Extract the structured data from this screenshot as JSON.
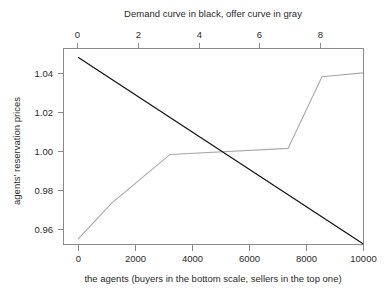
{
  "chart_data": {
    "type": "line",
    "title": "Demand curve in black, offer curve in gray",
    "xlabel": "the agents (buyers in the bottom scale, sellers in the top one)",
    "ylabel": "agents' reservation prices",
    "grid": false,
    "legend": "none",
    "xlim": [
      0,
      10000
    ],
    "ylim": [
      0.9505,
      1.0495
    ],
    "xticks": [
      0,
      2000,
      4000,
      6000,
      8000,
      10000
    ],
    "xtick_labels": [
      "0",
      "2000",
      "4000",
      "6000",
      "8000",
      "10000"
    ],
    "yticks": [
      0.96,
      0.98,
      1.0,
      1.02,
      1.04
    ],
    "ytick_labels": [
      "0.96",
      "0.98",
      "1.00",
      "1.02",
      "1.04"
    ],
    "top_axis": {
      "label": "sellers",
      "lim": [
        0,
        9.4
      ],
      "ticks": [
        0,
        2,
        4,
        6,
        8
      ],
      "tick_labels": [
        "0",
        "2",
        "4",
        "6",
        "8"
      ]
    },
    "series": [
      {
        "name": "Demand curve",
        "color": "#111111",
        "style": "solid",
        "x": [
          0,
          10000
        ],
        "y": [
          1.0483,
          0.9527
        ]
      },
      {
        "name": "Offer curve",
        "color": "#a9a9a9",
        "style": "solid",
        "x": [
          0,
          1190,
          3230,
          7370,
          8560,
          10000
        ],
        "y": [
          0.9551,
          0.9737,
          0.9985,
          1.0016,
          1.0383,
          1.0403
        ]
      }
    ],
    "intersection": {
      "x": 4950,
      "y": 1.0008
    }
  },
  "figure": {
    "title_text": "Demand curve in black, offer curve in gray",
    "y_axis_title": "agents' reservation prices",
    "x_axis_title": "the agents (buyers in the bottom scale, sellers in the top one)",
    "x_tick_0": "0",
    "x_tick_1": "2000",
    "x_tick_2": "4000",
    "x_tick_3": "6000",
    "x_tick_4": "8000",
    "x_tick_5": "10000",
    "y_tick_0": "0.96",
    "y_tick_1": "0.98",
    "y_tick_2": "1.00",
    "y_tick_3": "1.02",
    "y_tick_4": "1.04",
    "top_tick_0": "0",
    "top_tick_1": "2",
    "top_tick_2": "4",
    "top_tick_3": "6",
    "top_tick_4": "8"
  },
  "colors": {
    "demand": "#111111",
    "offer": "#a9a9a9",
    "frame": "#8a8a8a",
    "background": "#ffffff",
    "text": "#2b2b2b"
  }
}
